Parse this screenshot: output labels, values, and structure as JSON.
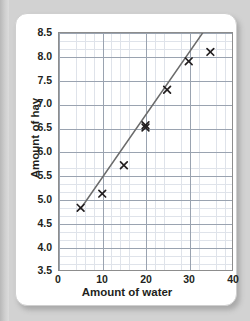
{
  "chart_data": {
    "type": "scatter",
    "title": "",
    "xlabel": "Amount of water",
    "ylabel": "Amount of hay",
    "xlim": [
      0,
      40
    ],
    "ylim": [
      3.5,
      8.5
    ],
    "xticks": [
      "0",
      "10",
      "20",
      "30",
      "40"
    ],
    "yticks": [
      "3.5",
      "4.0",
      "4.5",
      "5.0",
      "5.5",
      "6.0",
      "6.5",
      "7.0",
      "7.5",
      "8.0",
      "8.5"
    ],
    "grid": "major and minor gridlines, minor 5 per major",
    "legend": "none",
    "marker": "x",
    "marker_color": "#231f20",
    "x": [
      5,
      10,
      15,
      20,
      20,
      25,
      30,
      35
    ],
    "y": [
      4.8,
      5.1,
      5.7,
      6.5,
      6.55,
      7.3,
      7.9,
      8.1
    ],
    "points": [
      {
        "x": 5,
        "y": 4.8
      },
      {
        "x": 10,
        "y": 5.1
      },
      {
        "x": 15,
        "y": 5.7
      },
      {
        "x": 20,
        "y": 6.5
      },
      {
        "x": 20,
        "y": 6.55
      },
      {
        "x": 25,
        "y": 7.3
      },
      {
        "x": 30,
        "y": 7.9
      },
      {
        "x": 35,
        "y": 8.1
      }
    ],
    "trendline": {
      "label": "line of best fit",
      "color": "#6b6b6b",
      "x0": 5,
      "y0": 4.78,
      "x1": 33.2,
      "y1": 8.5
    }
  }
}
